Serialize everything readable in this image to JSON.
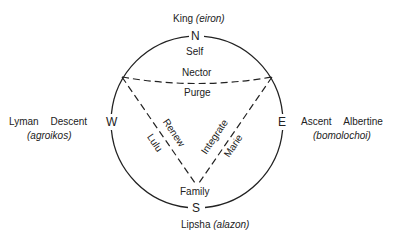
{
  "cardinals": {
    "north": "N",
    "south": "S",
    "west": "W",
    "east": "E"
  },
  "north": {
    "name": "King",
    "role": "(eiron)",
    "inner": "Self"
  },
  "south": {
    "name": "Lipsha",
    "role": "(alazon)",
    "inner": "Family"
  },
  "west": {
    "name": "Lyman",
    "movement": "Descent",
    "role": "(agroikos)"
  },
  "east": {
    "movement": "Ascent",
    "name": "Albertine",
    "role": "(bomolochoi)"
  },
  "triangle": {
    "top_edge_above": "Nector",
    "top_edge_below": "Purge",
    "left_edge_outer": "Lulu",
    "left_edge_inner": "Renew",
    "right_edge_inner": "Integrate",
    "right_edge_outer": "Marie"
  },
  "colors": {
    "stroke": "#222222",
    "background": "#ffffff"
  }
}
